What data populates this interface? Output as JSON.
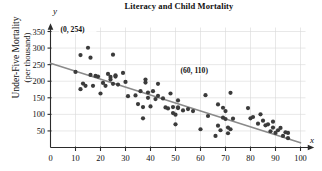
{
  "chart_data": {
    "type": "scatter",
    "title": "Literacy and Child Mortality",
    "xlabel": "x",
    "ylabel": "Under-Five Mortality (per thousand)",
    "ylabel_line1": "Under-Five Mortality",
    "ylabel_line2": "(per thousand)",
    "x_axis_letter": "x",
    "y_axis_letter": "y",
    "xlim": [
      0,
      103
    ],
    "ylim": [
      0,
      365
    ],
    "xticks": [
      0,
      10,
      20,
      30,
      40,
      50,
      60,
      70,
      80,
      90,
      100
    ],
    "yticks": [
      50,
      100,
      150,
      200,
      250,
      300,
      350
    ],
    "grid": true,
    "legend": null,
    "annotations": [
      {
        "text": "(0, 254)",
        "x": 4,
        "y": 350
      },
      {
        "text": "(60, 110)",
        "x": 52,
        "y": 225
      }
    ],
    "trendline": {
      "label": "regression line",
      "points": [
        [
          0,
          254
        ],
        [
          100,
          14
        ]
      ],
      "color": "#8a8a8a"
    },
    "point_color": "#3b3b3b",
    "points": [
      [
        10,
        228
      ],
      [
        12,
        279
      ],
      [
        12,
        176
      ],
      [
        13,
        193
      ],
      [
        14,
        186
      ],
      [
        15,
        301
      ],
      [
        16,
        219
      ],
      [
        16,
        271
      ],
      [
        17,
        186
      ],
      [
        18,
        216
      ],
      [
        19,
        214
      ],
      [
        20,
        163
      ],
      [
        21,
        195
      ],
      [
        22,
        186
      ],
      [
        23,
        222
      ],
      [
        24,
        205
      ],
      [
        24,
        213
      ],
      [
        25,
        192
      ],
      [
        25,
        280
      ],
      [
        26,
        214
      ],
      [
        26,
        218
      ],
      [
        27,
        190
      ],
      [
        29,
        225
      ],
      [
        30,
        198
      ],
      [
        31,
        155
      ],
      [
        34,
        157
      ],
      [
        35,
        131
      ],
      [
        36,
        170
      ],
      [
        37,
        122
      ],
      [
        37,
        88
      ],
      [
        38,
        205
      ],
      [
        38,
        196
      ],
      [
        39,
        166
      ],
      [
        39,
        150
      ],
      [
        40,
        124
      ],
      [
        41,
        170
      ],
      [
        42,
        146
      ],
      [
        43,
        192
      ],
      [
        43,
        156
      ],
      [
        45,
        148
      ],
      [
        46,
        121
      ],
      [
        47,
        118
      ],
      [
        48,
        163
      ],
      [
        49,
        104
      ],
      [
        49,
        122
      ],
      [
        50,
        99
      ],
      [
        50,
        70
      ],
      [
        51,
        142
      ],
      [
        51,
        119
      ],
      [
        51,
        121
      ],
      [
        53,
        112
      ],
      [
        55,
        116
      ],
      [
        57,
        110
      ],
      [
        60,
        55
      ],
      [
        62,
        158
      ],
      [
        63,
        95
      ],
      [
        66,
        35
      ],
      [
        67,
        130
      ],
      [
        67,
        66
      ],
      [
        68,
        52
      ],
      [
        69,
        90
      ],
      [
        69,
        120
      ],
      [
        70,
        110
      ],
      [
        70,
        86
      ],
      [
        71,
        60
      ],
      [
        71,
        43
      ],
      [
        72,
        165
      ],
      [
        72,
        55
      ],
      [
        73,
        87
      ],
      [
        79,
        119
      ],
      [
        80,
        88
      ],
      [
        81,
        92
      ],
      [
        83,
        72
      ],
      [
        84,
        100
      ],
      [
        85,
        81
      ],
      [
        86,
        67
      ],
      [
        87,
        70
      ],
      [
        88,
        49
      ],
      [
        89,
        78
      ],
      [
        89,
        60
      ],
      [
        90,
        44
      ],
      [
        91,
        52
      ],
      [
        92,
        59
      ],
      [
        93,
        35
      ],
      [
        94,
        46
      ],
      [
        95,
        28
      ],
      [
        95,
        44
      ]
    ]
  }
}
